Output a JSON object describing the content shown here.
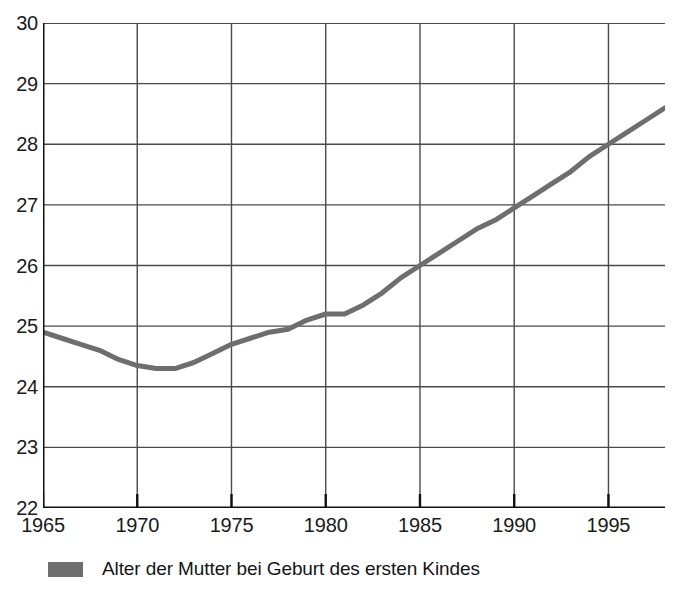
{
  "chart_data": {
    "type": "line",
    "title": "",
    "subtitle": "",
    "xlabel": "",
    "ylabel": "",
    "xlim": [
      1965,
      1998
    ],
    "ylim": [
      22,
      30
    ],
    "grid": true,
    "legend_position": "below",
    "x_major_ticks": [
      1965,
      1970,
      1975,
      1980,
      1985,
      1990,
      1995
    ],
    "x_tick_labels": [
      "1965",
      "1970",
      "1975",
      "1980",
      "1985",
      "1990",
      "1995"
    ],
    "x_minor_tick_step": 1,
    "y_major_ticks": [
      22,
      23,
      24,
      25,
      26,
      27,
      28,
      29,
      30
    ],
    "y_tick_labels": [
      "22",
      "23",
      "24",
      "25",
      "26",
      "27",
      "28",
      "29",
      "30"
    ],
    "series": [
      {
        "name": "Alter der Mutter bei Geburt des ersten Kindes",
        "color": "#6e6e6e",
        "x": [
          1965,
          1966,
          1967,
          1968,
          1969,
          1970,
          1971,
          1972,
          1973,
          1974,
          1975,
          1976,
          1977,
          1978,
          1979,
          1980,
          1981,
          1982,
          1983,
          1984,
          1985,
          1986,
          1987,
          1988,
          1989,
          1990,
          1991,
          1992,
          1993,
          1994,
          1995,
          1996,
          1997,
          1998
        ],
        "values": [
          24.9,
          24.8,
          24.7,
          24.6,
          24.45,
          24.35,
          24.3,
          24.3,
          24.4,
          24.55,
          24.7,
          24.8,
          24.9,
          24.95,
          25.1,
          25.2,
          25.2,
          25.35,
          25.55,
          25.8,
          26.0,
          26.2,
          26.4,
          26.6,
          26.75,
          26.95,
          27.15,
          27.35,
          27.55,
          27.8,
          28.0,
          28.2,
          28.4,
          28.6
        ]
      }
    ]
  },
  "legend": {
    "items": [
      {
        "label": "Alter der Mutter bei Geburt des ersten Kindes",
        "color": "#6e6e6e"
      }
    ]
  }
}
